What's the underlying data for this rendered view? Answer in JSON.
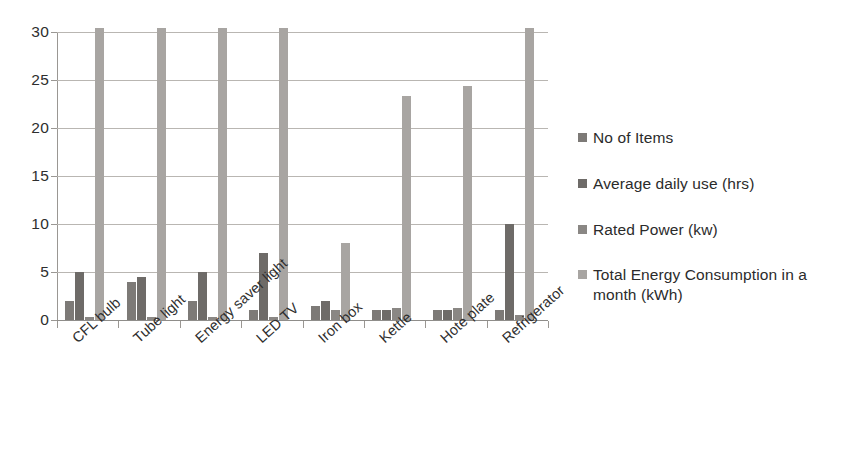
{
  "chart_data": {
    "type": "bar",
    "title": "",
    "subtitle": "",
    "xlabel": "",
    "ylabel": "",
    "grid": true,
    "legend_position": "right",
    "ylim": [
      0,
      30
    ],
    "yticks": [
      0,
      5,
      10,
      15,
      20,
      25,
      30
    ],
    "ytick_labels": [
      "0",
      "5",
      "10",
      "15",
      "20",
      "25",
      "30"
    ],
    "categories": [
      "CFL bulb",
      "Tube light",
      "Energy saver light",
      "LED TV",
      "Iron box",
      "Kettle",
      "Hote plate",
      "Refrigerator"
    ],
    "series": [
      {
        "name": "No of Items",
        "color": "#7d7a77",
        "values": [
          2,
          4,
          2,
          1,
          1.5,
          1,
          1,
          1
        ]
      },
      {
        "name": "Average daily use (hrs)",
        "color": "#6e6b68",
        "values": [
          5,
          4.5,
          5,
          7,
          2,
          1,
          1,
          10
        ]
      },
      {
        "name": "Rated Power (kw)",
        "color": "#8a8784",
        "values": [
          0.3,
          0.3,
          0.3,
          0.3,
          1,
          1.2,
          1.2,
          0.5
        ]
      },
      {
        "name": "Total Energy Consumption in a month (kWh)",
        "color": "#a8a5a2",
        "values": [
          34,
          34,
          34,
          34,
          8,
          23.3,
          24.4,
          34
        ]
      }
    ]
  },
  "legend": {
    "items": [
      {
        "label": "No of Items",
        "color": "#7d7a77"
      },
      {
        "label": "Average daily use (hrs)",
        "color": "#6e6b68"
      },
      {
        "label": "Rated Power (kw)",
        "color": "#8a8784"
      },
      {
        "label": "Total Energy Consumption in a month (kWh)",
        "color": "#a8a5a2"
      }
    ]
  },
  "scan_artifacts": {
    "top_right_ghost": "",
    "left_ghost_a": "",
    "left_ghost_b": ""
  }
}
